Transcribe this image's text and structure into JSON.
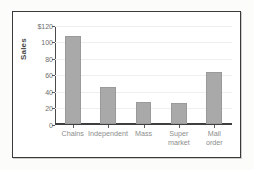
{
  "chart_data": {
    "type": "bar",
    "title": "",
    "xlabel": "",
    "ylabel": "Sales",
    "categories": [
      "Chains",
      "Independent",
      "Mass",
      "Super\nmarket",
      "Mail\norder"
    ],
    "values": [
      107,
      45,
      27,
      26,
      63
    ],
    "ylim": [
      0,
      120
    ],
    "ytick_values": [
      0,
      20,
      40,
      60,
      80,
      100,
      120
    ],
    "ytick_labels": [
      "0",
      "20",
      "40",
      "60",
      "80",
      "100",
      "$120"
    ],
    "grid": true,
    "legend": "none",
    "bar_color": "#a9a9a9",
    "axis_color": "#3f3f3f",
    "frame_color": "#3a3a3a",
    "label_color": "#8d8d8d",
    "tick_label_color": "#6d6d6d"
  }
}
